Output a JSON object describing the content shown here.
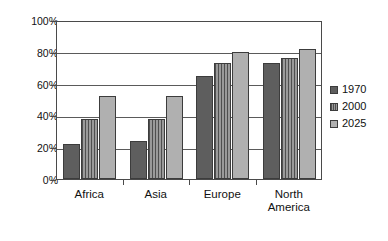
{
  "chart_data": {
    "type": "bar",
    "title": "",
    "subtitle": "",
    "xlabel": "",
    "ylabel": "",
    "categories": [
      "Africa",
      "Asia",
      "Europe",
      "North\nAmerica"
    ],
    "series": [
      {
        "name": "1970",
        "values": [
          22,
          24,
          65,
          73
        ],
        "color": "#5e5e5e",
        "fill": "solid"
      },
      {
        "name": "2000",
        "values": [
          38,
          38,
          73,
          76
        ],
        "color": "#8a8a8a",
        "fill": "vertical-stripes"
      },
      {
        "name": "2025",
        "values": [
          52,
          52,
          80,
          82
        ],
        "color": "#b0b0b0",
        "fill": "solid"
      }
    ],
    "ylim": [
      0,
      100
    ],
    "ytick_values": [
      0,
      20,
      40,
      60,
      80,
      100
    ],
    "ytick_labels": [
      "0%",
      "20%",
      "40%",
      "60%",
      "80%",
      "100%"
    ],
    "grid": "horizontal",
    "legend_position": "right",
    "value_suffix": "%"
  },
  "legend": {
    "items": [
      {
        "label": "1970"
      },
      {
        "label": "2000"
      },
      {
        "label": "2025"
      }
    ]
  }
}
